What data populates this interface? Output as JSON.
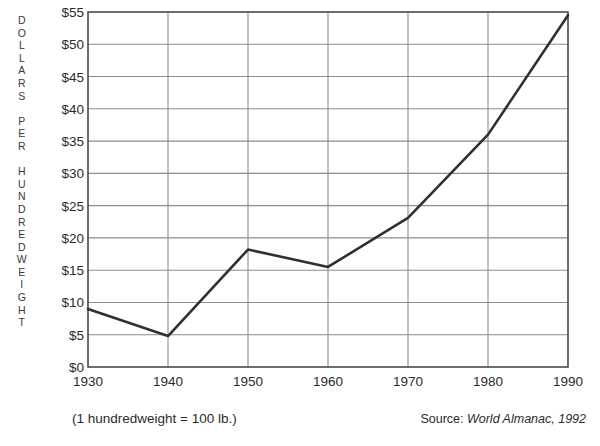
{
  "chart_data": {
    "type": "line",
    "title": "",
    "xlabel": "",
    "ylabel": "DOLLARS PER HUNDREDWEIGHT",
    "x": [
      1930,
      1940,
      1950,
      1960,
      1970,
      1980,
      1990
    ],
    "values": [
      9.0,
      4.8,
      18.2,
      15.5,
      23.1,
      36.0,
      54.5
    ],
    "series": [
      {
        "name": "Dollars per hundredweight",
        "values": [
          9.0,
          4.8,
          18.2,
          15.5,
          23.1,
          36.0,
          54.5
        ]
      }
    ],
    "xlim": [
      1930,
      1990
    ],
    "ylim": [
      0,
      55
    ],
    "ytick_values": [
      0,
      5,
      10,
      15,
      20,
      25,
      30,
      35,
      40,
      45,
      50,
      55
    ],
    "ytick_labels": [
      "$0",
      "$5",
      "$10",
      "$15",
      "$20",
      "$25",
      "$30",
      "$35",
      "$40",
      "$45",
      "$50",
      "$55"
    ],
    "xtick_values": [
      1930,
      1940,
      1950,
      1960,
      1970,
      1980,
      1990
    ],
    "xtick_labels": [
      "1930",
      "1940",
      "1950",
      "1960",
      "1970",
      "1980",
      "1990"
    ],
    "grid": "both",
    "legend": "none",
    "line_color": "#332f2e",
    "grid_color": "#8d8d8d",
    "axis_color": "#4a4a4a",
    "background": "#ffffff"
  },
  "axis": {
    "y_title_letters": [
      "D",
      "O",
      "L",
      "L",
      "A",
      "R",
      "S",
      "",
      "P",
      "E",
      "R",
      "",
      "H",
      "U",
      "N",
      "D",
      "R",
      "E",
      "D",
      "W",
      "E",
      "I",
      "G",
      "H",
      "T"
    ],
    "y_title_text": "DOLLARS PER HUNDREDWEIGHT"
  },
  "footnotes": {
    "left": "(1 hundredweight = 100 lb.)",
    "source_prefix": "Source: ",
    "source_italic": "World Almanac, 1992"
  }
}
